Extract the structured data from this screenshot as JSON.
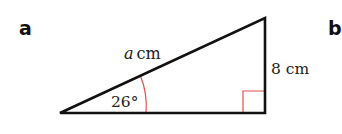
{
  "panels": [
    {
      "label": "a"
    },
    {
      "label": "b"
    }
  ],
  "triangle": {
    "hypotenuse_label_var": "a",
    "hypotenuse_label_unit": "cm",
    "opposite_label": "8 cm",
    "angle_label": "26°",
    "right_angle_marker": true
  },
  "colors": {
    "stroke": "#111111",
    "angle_mark": "#e0504a",
    "right_angle_mark": "#e0504a"
  }
}
